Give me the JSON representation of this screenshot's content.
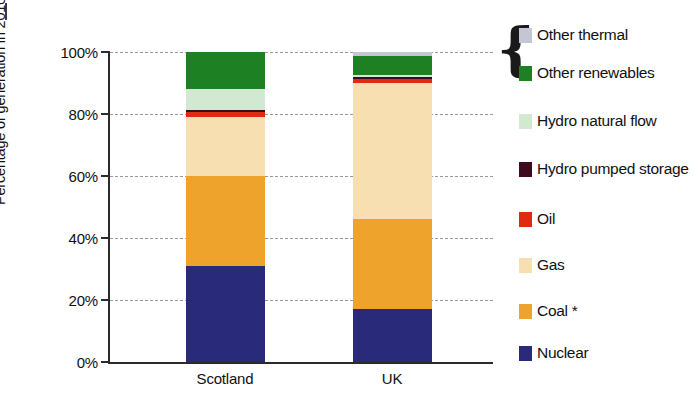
{
  "chart_data": {
    "type": "bar",
    "stacked": true,
    "title": "",
    "xlabel": "",
    "ylabel": "Percentage of generation in 2010",
    "ylim": [
      0,
      100
    ],
    "ytick_labels": [
      "0%",
      "20%",
      "40%",
      "60%",
      "80%",
      "100%"
    ],
    "ytick_values": [
      0,
      20,
      40,
      60,
      80,
      100
    ],
    "grid": true,
    "legend_position": "right",
    "categories": [
      "Scotland",
      "UK"
    ],
    "series": [
      {
        "name": "Nuclear",
        "color": "#2a2a7a",
        "values": [
          31,
          17
        ]
      },
      {
        "name": "Coal *",
        "color": "#eda32c",
        "values": [
          29,
          29
        ]
      },
      {
        "name": "Gas",
        "color": "#f7dfb2",
        "values": [
          19,
          44
        ]
      },
      {
        "name": "Oil",
        "color": "#e02b13",
        "values": [
          1.5,
          1.2
        ]
      },
      {
        "name": "Hydro pumped storage",
        "color": "#3d0b1e",
        "values": [
          0.8,
          0.6
        ]
      },
      {
        "name": "Hydro natural flow",
        "color": "#d3e8d0",
        "values": [
          6.7,
          0.7
        ]
      },
      {
        "name": "Other renewables",
        "color": "#1d8022",
        "values": [
          12,
          6.3
        ]
      },
      {
        "name": "Other thermal",
        "color": "#c3c7d4",
        "values": [
          0,
          1.2
        ]
      }
    ],
    "footnote_marker": "*"
  },
  "legend": {
    "brace_glyph": "{",
    "items": [
      {
        "label": "Other thermal",
        "color": "#c3c7d4"
      },
      {
        "label": "Other renewables",
        "color": "#1d8022"
      },
      {
        "label": "Hydro natural flow",
        "color": "#d3e8d0"
      },
      {
        "label": "Hydro pumped storage",
        "color": "#3d0b1e"
      },
      {
        "label": "Oil",
        "color": "#e02b13"
      },
      {
        "label": "Gas",
        "color": "#f7dfb2"
      },
      {
        "label": "Coal *",
        "color": "#eda32c"
      },
      {
        "label": "Nuclear",
        "color": "#2a2a7a"
      }
    ]
  }
}
